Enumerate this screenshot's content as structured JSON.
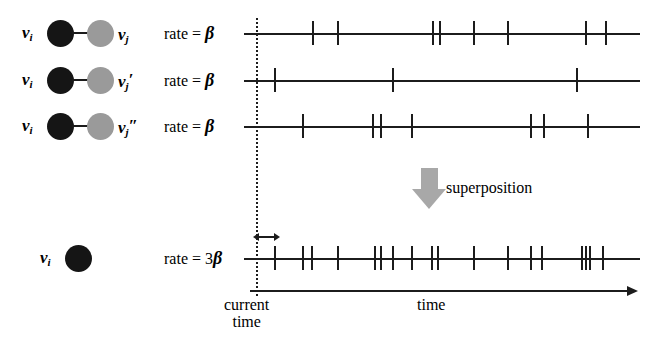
{
  "figure": {
    "superposition_label": "superposition",
    "current_time_label_line1": "current",
    "current_time_label_line2": "time",
    "time_axis_label": "time",
    "colors": {
      "source_node": "#151515",
      "target_node": "#9a9a9a",
      "arrow_gray": "#a8a8a8",
      "ink": "#1c1c1c"
    }
  },
  "edges": [
    {
      "source_label": "v",
      "source_sub": "i",
      "target_label": "v",
      "target_sub": "j",
      "target_prime": "",
      "rate_text": "rate = ",
      "rate_value": "β",
      "axis_y": 33,
      "events": [
        313,
        338,
        433,
        440,
        474,
        508,
        586,
        606
      ]
    },
    {
      "source_label": "v",
      "source_sub": "i",
      "target_label": "v",
      "target_sub": "j",
      "target_prime": "′",
      "rate_text": "rate = ",
      "rate_value": "β",
      "axis_y": 80,
      "events": [
        275,
        393,
        577
      ]
    },
    {
      "source_label": "v",
      "source_sub": "i",
      "target_label": "v",
      "target_sub": "j",
      "target_prime": "″",
      "rate_text": "rate = ",
      "rate_value": "β",
      "axis_y": 126,
      "events": [
        303,
        373,
        381,
        412,
        531,
        544,
        588
      ]
    }
  ],
  "superposed": {
    "source_label": "v",
    "source_sub": "i",
    "rate_text": "rate = 3",
    "rate_value": "β",
    "axis_y": 258,
    "events": [
      275,
      303,
      312,
      338,
      375,
      381,
      393,
      412,
      432,
      438,
      474,
      508,
      531,
      542,
      582,
      586,
      590,
      603
    ],
    "waiting_arrow": {
      "from": 258,
      "to": 275
    }
  },
  "current_time_x": 256
}
